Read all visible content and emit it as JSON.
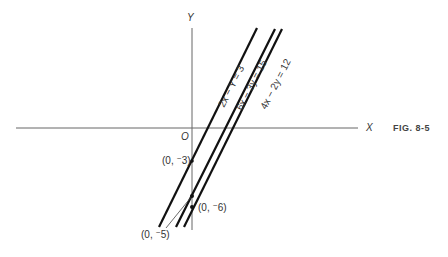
{
  "figure": {
    "caption": "FIG. 8-5",
    "axes": {
      "x_label": "X",
      "y_label": "Y",
      "origin_label": "O"
    },
    "lines": [
      {
        "equation": "2x − Y = 3",
        "y_intercept": "(0, ⁻3)"
      },
      {
        "equation": "6x − 3y = 15",
        "y_intercept": "(0, ⁻5)"
      },
      {
        "equation": "4x − 2y = 12",
        "y_intercept": "(0, ⁻6)"
      }
    ],
    "points": [
      {
        "label": "(0, ⁻3)"
      },
      {
        "label": "(0, ⁻5)"
      },
      {
        "label": "(0, ⁻6)"
      }
    ],
    "colors": {
      "line": "#111111",
      "axis": "#555555",
      "text": "#333333"
    }
  }
}
